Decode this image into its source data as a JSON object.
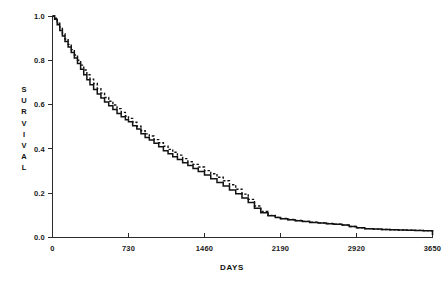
{
  "chart_data": {
    "type": "line",
    "title": "",
    "subtitle": "",
    "xlabel": "DAYS",
    "ylabel": "SURVIVAL",
    "ylabel_letters": [
      "S",
      "U",
      "R",
      "V",
      "I",
      "V",
      "A",
      "L"
    ],
    "xlim": [
      0,
      3650
    ],
    "ylim": [
      0.0,
      1.0
    ],
    "grid": false,
    "legend": "none",
    "xticks": [
      0,
      730,
      1460,
      2190,
      2920,
      3650
    ],
    "xtick_labels": [
      "0",
      "730",
      "1460",
      "2190",
      "2920",
      "3650"
    ],
    "yticks": [
      0.0,
      0.2,
      0.4,
      0.6,
      0.8,
      1.0
    ],
    "ytick_labels": [
      "0.0",
      "0.2",
      "0.4",
      "0.6",
      "0.8",
      "1.0"
    ],
    "annotations": [],
    "series": [
      {
        "name": "solid-curve",
        "style": "solid",
        "color": "#121212",
        "x": [
          0,
          20,
          45,
          70,
          95,
          120,
          150,
          180,
          210,
          240,
          270,
          300,
          330,
          360,
          395,
          430,
          465,
          500,
          540,
          580,
          620,
          660,
          700,
          730,
          770,
          810,
          850,
          890,
          930,
          975,
          1020,
          1065,
          1110,
          1155,
          1200,
          1250,
          1300,
          1350,
          1400,
          1460,
          1520,
          1580,
          1640,
          1700,
          1760,
          1820,
          1880,
          1940,
          2000,
          2070,
          2140,
          2190,
          2260,
          2330,
          2400,
          2470,
          2550,
          2630,
          2700,
          2780,
          2850,
          2920,
          3000,
          3080,
          3160,
          3240,
          3320,
          3400,
          3480,
          3560,
          3620,
          3650
        ],
        "y": [
          1.0,
          0.985,
          0.96,
          0.935,
          0.91,
          0.885,
          0.86,
          0.835,
          0.81,
          0.785,
          0.76,
          0.735,
          0.712,
          0.69,
          0.668,
          0.648,
          0.63,
          0.612,
          0.595,
          0.578,
          0.56,
          0.545,
          0.532,
          0.523,
          0.505,
          0.49,
          0.468,
          0.452,
          0.44,
          0.425,
          0.41,
          0.392,
          0.378,
          0.365,
          0.352,
          0.338,
          0.325,
          0.312,
          0.298,
          0.282,
          0.265,
          0.248,
          0.232,
          0.215,
          0.198,
          0.178,
          0.158,
          0.132,
          0.112,
          0.098,
          0.09,
          0.085,
          0.08,
          0.076,
          0.072,
          0.068,
          0.065,
          0.062,
          0.06,
          0.056,
          0.05,
          0.044,
          0.04,
          0.038,
          0.036,
          0.035,
          0.034,
          0.033,
          0.032,
          0.031,
          0.03,
          0.012
        ]
      },
      {
        "name": "dashed-curve",
        "style": "dashed",
        "color": "#121212",
        "x": [
          0,
          20,
          45,
          70,
          95,
          120,
          150,
          180,
          210,
          240,
          270,
          300,
          330,
          360,
          395,
          430,
          465,
          500,
          540,
          580,
          620,
          660,
          700,
          730,
          770,
          810,
          850,
          890,
          930,
          975,
          1020,
          1065,
          1110,
          1155,
          1200,
          1250,
          1300,
          1350,
          1400,
          1460,
          1520,
          1580,
          1640,
          1700,
          1760,
          1820,
          1880,
          1940,
          2000,
          2070,
          2140,
          2190,
          2260,
          2330,
          2400,
          2470,
          2550,
          2630,
          2700,
          2780,
          2850,
          2920,
          3000,
          3080,
          3160,
          3240,
          3320,
          3400,
          3480,
          3560,
          3620,
          3650
        ],
        "y": [
          1.0,
          0.99,
          0.968,
          0.944,
          0.92,
          0.896,
          0.872,
          0.848,
          0.824,
          0.8,
          0.778,
          0.756,
          0.735,
          0.715,
          0.695,
          0.672,
          0.652,
          0.632,
          0.615,
          0.598,
          0.582,
          0.565,
          0.548,
          0.538,
          0.52,
          0.502,
          0.482,
          0.468,
          0.458,
          0.442,
          0.428,
          0.412,
          0.398,
          0.385,
          0.372,
          0.356,
          0.342,
          0.33,
          0.318,
          0.302,
          0.288,
          0.272,
          0.256,
          0.238,
          0.218,
          0.196,
          0.172,
          0.142,
          0.118,
          0.1,
          0.091,
          0.086,
          0.081,
          0.077,
          0.073,
          0.069,
          0.066,
          0.063,
          0.06,
          0.056,
          0.05,
          0.044,
          0.04,
          0.038,
          0.036,
          0.035,
          0.034,
          0.033,
          0.032,
          0.031,
          0.03,
          0.012
        ]
      }
    ]
  }
}
